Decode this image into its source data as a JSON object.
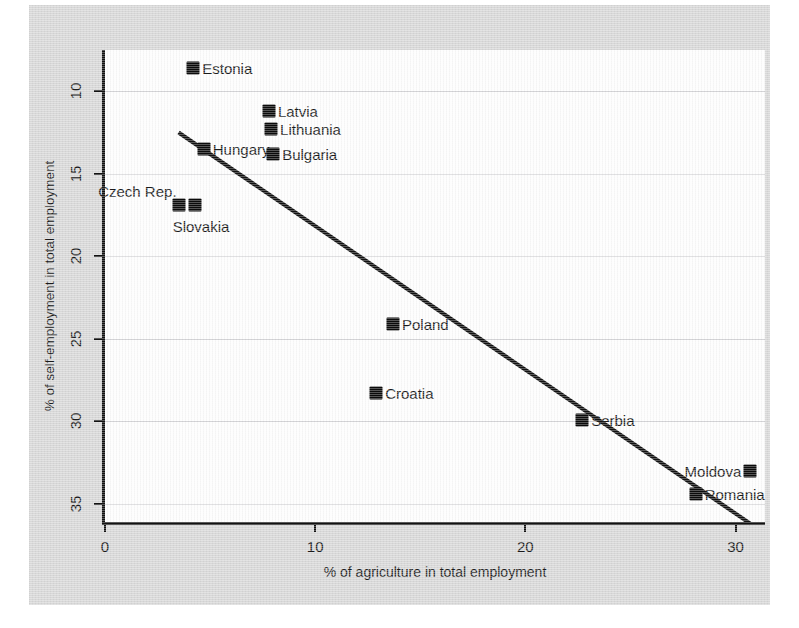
{
  "chart_data": {
    "type": "scatter",
    "title": "",
    "xlabel": "% of agriculture in total employment",
    "ylabel": "% of self-employment in total employment",
    "xlim": [
      0,
      31.4
    ],
    "ylim": [
      7.5,
      36.1
    ],
    "y_inverted": true,
    "grid": true,
    "legend": "none",
    "xticks": [
      0,
      10,
      20,
      30
    ],
    "xtick_labels": [
      "0",
      "10",
      "20",
      "30"
    ],
    "yticks": [
      10,
      15,
      20,
      25,
      30,
      35
    ],
    "ytick_labels": [
      "10",
      "15",
      "20",
      "25",
      "30",
      "35"
    ],
    "marker_color": "#0b0b0b",
    "line_color": "#111111",
    "points": [
      {
        "label": "Estonia",
        "x": 4.2,
        "y": 8.6,
        "label_pos": "right"
      },
      {
        "label": "Latvia",
        "x": 7.8,
        "y": 11.2,
        "label_pos": "right"
      },
      {
        "label": "Lithuania",
        "x": 7.9,
        "y": 12.3,
        "label_pos": "right"
      },
      {
        "label": "Hungary",
        "x": 4.7,
        "y": 13.5,
        "label_pos": "right"
      },
      {
        "label": "Bulgaria",
        "x": 8.0,
        "y": 13.8,
        "label_pos": "right"
      },
      {
        "label": "Czech Rep.",
        "x": 3.5,
        "y": 16.9,
        "label_pos": "aboveleft"
      },
      {
        "label": "Slovakia",
        "x": 4.3,
        "y": 16.9,
        "label_pos": "below"
      },
      {
        "label": "Poland",
        "x": 13.7,
        "y": 24.1,
        "label_pos": "right"
      },
      {
        "label": "Croatia",
        "x": 12.9,
        "y": 28.3,
        "label_pos": "right"
      },
      {
        "label": "Serbia",
        "x": 22.7,
        "y": 29.9,
        "label_pos": "right"
      },
      {
        "label": "Moldova",
        "x": 30.7,
        "y": 33.0,
        "label_pos": "left"
      },
      {
        "label": "Romania",
        "x": 28.1,
        "y": 34.4,
        "label_pos": "right"
      }
    ],
    "trend_line": {
      "x_start": 3.5,
      "y_start": 12.5,
      "x_end": 30.7,
      "y_end": 36.2
    }
  }
}
